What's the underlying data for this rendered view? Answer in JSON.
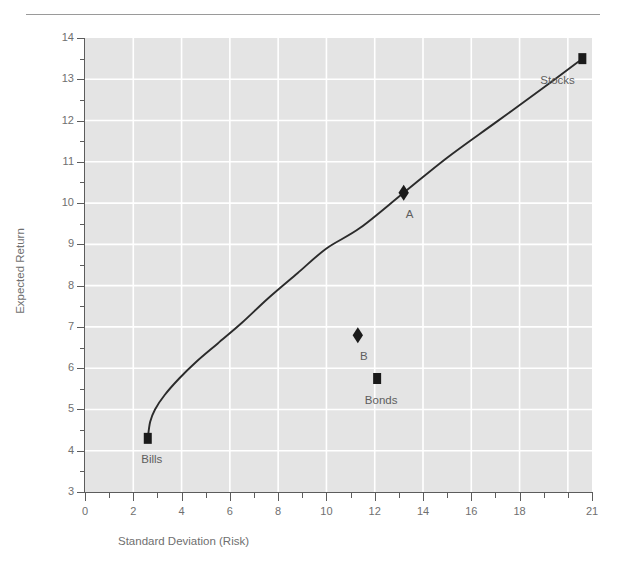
{
  "chart_data": {
    "type": "line",
    "title": "",
    "subtitle": "",
    "xlabel": "Standard Deviation (Risk)",
    "ylabel": "Expected Return",
    "xlim": [
      0,
      21
    ],
    "ylim": [
      3,
      14
    ],
    "grid": true,
    "legend": "none",
    "x_ticks_major": [
      0,
      2,
      4,
      6,
      8,
      10,
      12,
      14,
      16,
      18,
      21
    ],
    "x_tick_labels": [
      "0",
      "2",
      "4",
      "6",
      "8",
      "10",
      "12",
      "14",
      "16",
      "18",
      "21"
    ],
    "x_ticks_minor": [
      1,
      3,
      5,
      7,
      9,
      11,
      13,
      15,
      17,
      19,
      20
    ],
    "y_ticks_major": [
      3,
      4,
      5,
      6,
      7,
      8,
      9,
      10,
      11,
      12,
      13,
      14
    ],
    "y_tick_labels": [
      "3",
      "4",
      "5",
      "6",
      "7",
      "8",
      "9",
      "10",
      "11",
      "12",
      "13",
      "14"
    ],
    "y_ticks_minor": [
      3.5,
      4.5,
      5.5,
      6.5,
      7.5,
      8.5,
      9.5,
      10.5,
      11.5,
      12.5,
      13.5
    ],
    "gridlines_x": [
      2,
      4,
      6,
      8,
      10,
      12,
      14,
      16,
      18,
      20
    ],
    "gridlines_y": [
      4,
      5,
      6,
      7,
      8,
      9,
      10,
      11,
      12,
      13
    ],
    "series": [
      {
        "name": "Capital Allocation / Efficient Frontier",
        "type": "line",
        "color": "#2b2b2b",
        "points": [
          {
            "x": 2.6,
            "y": 4.3
          },
          {
            "x": 2.7,
            "y": 4.7
          },
          {
            "x": 2.9,
            "y": 5.0
          },
          {
            "x": 3.3,
            "y": 5.35
          },
          {
            "x": 3.9,
            "y": 5.75
          },
          {
            "x": 4.6,
            "y": 6.15
          },
          {
            "x": 5.5,
            "y": 6.6
          },
          {
            "x": 6.5,
            "y": 7.1
          },
          {
            "x": 7.6,
            "y": 7.7
          },
          {
            "x": 8.8,
            "y": 8.3
          },
          {
            "x": 10.0,
            "y": 8.9
          },
          {
            "x": 11.4,
            "y": 9.4
          },
          {
            "x": 13.2,
            "y": 10.25
          },
          {
            "x": 15.0,
            "y": 11.1
          },
          {
            "x": 17.0,
            "y": 11.95
          },
          {
            "x": 19.0,
            "y": 12.8
          },
          {
            "x": 20.6,
            "y": 13.5
          }
        ]
      }
    ],
    "markers": [
      {
        "label": "Bills",
        "x": 2.6,
        "y": 4.3,
        "shape": "square",
        "color": "#1a1a1a",
        "label_dx": -2,
        "label_dy": 22
      },
      {
        "label": "Stocks",
        "x": 20.6,
        "y": 13.5,
        "shape": "square",
        "color": "#1a1a1a",
        "label_dx": -28,
        "label_dy": 22
      },
      {
        "label": "A",
        "x": 13.2,
        "y": 10.25,
        "shape": "diamond",
        "color": "#1a1a1a",
        "label_dx": 0,
        "label_dy": 22
      },
      {
        "label": "B",
        "x": 11.3,
        "y": 6.8,
        "shape": "diamond",
        "color": "#1a1a1a",
        "label_dx": 0,
        "label_dy": 22
      },
      {
        "label": "Bonds",
        "x": 12.1,
        "y": 5.75,
        "shape": "square",
        "color": "#1a1a1a",
        "label_dx": -2,
        "label_dy": 22
      }
    ],
    "colors": {
      "plot_background": "#e4e4e4",
      "gridline": "#ffffff",
      "axis": "#5c5c5c",
      "curve": "#2b2b2b",
      "marker": "#1a1a1a",
      "text": "#6f6f6f",
      "top_rule": "#9a9a9a",
      "page_background": "#ffffff"
    }
  }
}
